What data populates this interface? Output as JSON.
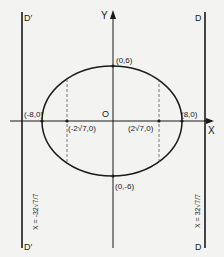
{
  "diagram": {
    "type": "ellipse-with-directrices",
    "axes": {
      "x_label": "X",
      "y_label": "Y",
      "origin_label": "O"
    },
    "vertices": {
      "left": "(-8,0)",
      "right": "(8,0)",
      "top": "(0,6)",
      "bottom": "(0,-6)"
    },
    "foci": {
      "left": "(-2√7,0)",
      "right": "(2√7,0)"
    },
    "directrices": {
      "left": {
        "top_label": "D′",
        "bottom_label": "D′",
        "equation": "X = -32√7/7"
      },
      "right": {
        "top_label": "D",
        "bottom_label": "D",
        "equation": "X = 32√7/7"
      }
    },
    "colors": {
      "ink": "#1a1a1a",
      "paper": "#f3f3f1"
    }
  }
}
